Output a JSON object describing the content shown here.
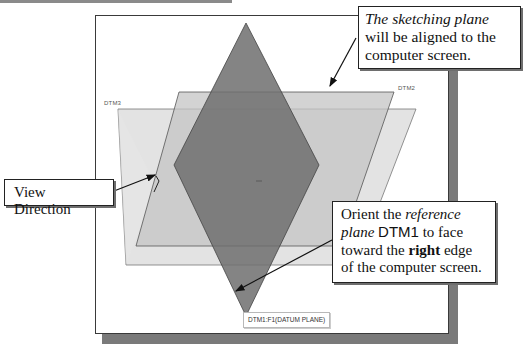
{
  "diagram": {
    "datum_planes": [
      {
        "id": "dtm3",
        "label": "DTM3",
        "fill": "#dedede"
      },
      {
        "id": "dtm2",
        "label": "DTM2",
        "fill": "#c9c9c9"
      },
      {
        "id": "dtm1",
        "label": "DTM1",
        "fill": "#7d7d7d"
      }
    ],
    "callouts": {
      "sketching_plane": {
        "italic": "The sketching plane",
        "rest": " will be aligned to the computer screen."
      },
      "view_direction": {
        "text": "View Direction"
      },
      "reference_plane": {
        "t1": "Orient the ",
        "italic1": "reference plane",
        "t2": " ",
        "sans": "DTM1",
        "t3": " to face toward the ",
        "bold": "right",
        "t4": " edge of the computer screen."
      }
    },
    "tooltip": {
      "text": "DTM1:F1(DATUM PLANE)"
    },
    "colors": {
      "viewport_border": "#3a3a3a",
      "viewport_shadow": "#7a7a7a",
      "plane_light": "#dedede",
      "plane_mid": "#c9c9c9",
      "plane_dark": "#7d7d7d"
    }
  }
}
